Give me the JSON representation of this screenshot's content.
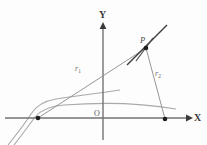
{
  "figure": {
    "type": "geometry-diagram",
    "background_color": "#fdfdfd",
    "stroke_color": "#6b6b6b",
    "axis_color": "#707070",
    "accent_color": "#2b2b2b",
    "labels": {
      "y_axis": "Y",
      "x_axis": "X",
      "origin": "O",
      "point_p": "P",
      "radius_1": "r",
      "radius_1_sub": "1",
      "radius_2": "r",
      "radius_2_sub": "2"
    },
    "geometry": {
      "origin": [
        103,
        118
      ],
      "point_p": [
        146,
        48
      ],
      "focus_left": [
        38,
        118
      ],
      "focus_right": [
        165,
        119
      ],
      "y_axis_top": [
        103,
        24
      ],
      "y_axis_bottom": [
        103,
        140
      ],
      "x_axis_left": [
        5,
        118
      ],
      "x_axis_right": [
        190,
        118
      ],
      "tangent_start": [
        128,
        64
      ],
      "tangent_end": [
        166,
        26
      ],
      "normal_start": [
        137,
        60
      ],
      "normal_end": [
        152,
        39
      ]
    }
  }
}
